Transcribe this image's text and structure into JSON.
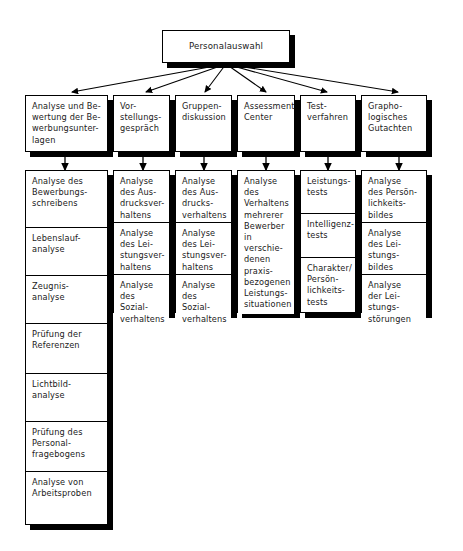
{
  "diagram": {
    "title": "Personalauswahl",
    "type": "organigramm-tree",
    "root": {
      "label": "Personalauswahl"
    },
    "columns": [
      {
        "id": "bewerbungsunterlagen",
        "header": "Analyse und Be-\nwertung der Be-\nwerbungsunter-\nlagen",
        "items": [
          "Analyse des\nBewerbungs-\nschreibens",
          "Lebenslauf-\nanalyse",
          "Zeugnis-\nanalyse",
          "Prüfung der\nReferenzen",
          "Lichtbild-\nanalyse",
          "Prüfung des\nPersonal-\nfragebogens",
          "Analyse von\nArbeitsproben"
        ]
      },
      {
        "id": "vorstellungsgespraech",
        "header": "Vor-\nstellungs-\ngespräch",
        "items": [
          "Analyse\ndes Aus-\ndrucksver-\nhaltens",
          "Analyse\ndes Lei-\nstungsver-\nhaltens",
          "Analyse\ndes Sozial-\nverhaltens"
        ]
      },
      {
        "id": "gruppendiskussion",
        "header": "Gruppen-\ndiskussion",
        "items": [
          "Analyse\ndes Aus-\ndrucks-\nverhaltens",
          "Analyse\ndes Lei-\nstungsver-\nhaltens",
          "Analyse\ndes Sozial-\nverhaltens"
        ]
      },
      {
        "id": "assessment-center",
        "header": "Assessment\nCenter",
        "items": [
          "Analyse\ndes\nVerhaltens\nmehrerer\nBewerber\nin verschie-\ndenen\npraxis-\nbezogenen\nLeistungs-\nsituationen"
        ]
      },
      {
        "id": "testverfahren",
        "header": "Test-\nverfahren",
        "items": [
          "Leistungs-\ntests",
          "Intelligenz-\ntests",
          "Charakter/\nPersön-\nlichkeits-\ntests"
        ]
      },
      {
        "id": "graphologisches-gutachten",
        "header": "Grapho-\nlogisches\nGutachten",
        "items": [
          "Analyse\ndes Persön-\nlichkeits-\nbildes",
          "Analyse\ndes Lei-\nstungs-\nbildes",
          "Analyse\nder Lei-\nstungs-\nstörungen"
        ]
      }
    ]
  },
  "colors": {
    "line": "#000000",
    "box_fill": "#ffffff",
    "shadow": "#000000",
    "text": "#1a1a1a"
  }
}
